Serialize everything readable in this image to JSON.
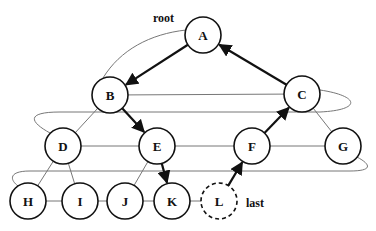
{
  "labels": {
    "root": "root",
    "last": "last"
  },
  "nodes": [
    {
      "id": "A",
      "label": "A",
      "x": 203,
      "y": 35,
      "style": "solid"
    },
    {
      "id": "B",
      "label": "B",
      "x": 110,
      "y": 95,
      "style": "solid"
    },
    {
      "id": "C",
      "label": "C",
      "x": 302,
      "y": 94,
      "style": "solid"
    },
    {
      "id": "D",
      "label": "D",
      "x": 63,
      "y": 146,
      "style": "solid"
    },
    {
      "id": "E",
      "label": "E",
      "x": 157,
      "y": 146,
      "style": "solid"
    },
    {
      "id": "F",
      "label": "F",
      "x": 252,
      "y": 146,
      "style": "solid"
    },
    {
      "id": "G",
      "label": "G",
      "x": 343,
      "y": 146,
      "style": "solid"
    },
    {
      "id": "H",
      "label": "H",
      "x": 28,
      "y": 201,
      "style": "solid"
    },
    {
      "id": "I",
      "label": "I",
      "x": 80,
      "y": 201,
      "style": "solid"
    },
    {
      "id": "J",
      "label": "J",
      "x": 125,
      "y": 201,
      "style": "solid"
    },
    {
      "id": "K",
      "label": "K",
      "x": 172,
      "y": 201,
      "style": "solid"
    },
    {
      "id": "L",
      "label": "L",
      "x": 219,
      "y": 201,
      "style": "dashed"
    }
  ],
  "tree_edges": [
    [
      "B",
      "D"
    ],
    [
      "C",
      "G"
    ],
    [
      "D",
      "H"
    ],
    [
      "D",
      "I"
    ],
    [
      "E",
      "J"
    ]
  ],
  "level_links": [
    [
      "B",
      "C"
    ],
    [
      "D",
      "E"
    ],
    [
      "E",
      "F"
    ],
    [
      "F",
      "G"
    ],
    [
      "H",
      "I"
    ],
    [
      "I",
      "J"
    ],
    [
      "J",
      "K"
    ],
    [
      "K",
      "L"
    ]
  ],
  "path_arrows": [
    [
      "A",
      "B"
    ],
    [
      "B",
      "E"
    ],
    [
      "E",
      "K"
    ],
    [
      "L",
      "F"
    ],
    [
      "F",
      "C"
    ],
    [
      "C",
      "A"
    ]
  ],
  "colors": {
    "node_stroke": "#111111",
    "thin_line": "#777777",
    "arrow": "#111111",
    "background": "#ffffff"
  }
}
